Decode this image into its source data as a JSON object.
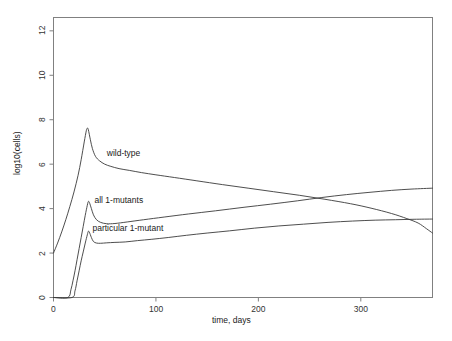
{
  "chart_data": {
    "type": "line",
    "title": "",
    "xlabel": "time, days",
    "ylabel": "log10(cells)",
    "xlim": [
      0,
      370
    ],
    "ylim": [
      0,
      12.6
    ],
    "xticks": [
      0,
      100,
      200,
      300
    ],
    "yticks": [
      0,
      2,
      4,
      6,
      8,
      10,
      12
    ],
    "grid": false,
    "legend": "inline-annotations",
    "annotations": [
      {
        "text": "wild-type",
        "x": 52,
        "y": 6.45
      },
      {
        "text": "all 1-mutants",
        "x": 40,
        "y": 4.35
      },
      {
        "text": "particular 1-mutant",
        "x": 38,
        "y": 3.1
      }
    ],
    "series": [
      {
        "name": "wild-type",
        "x": [
          0,
          4,
          8,
          12,
          16,
          20,
          24,
          27,
          30,
          32,
          33,
          34,
          36,
          38,
          41,
          45,
          50,
          56,
          64,
          74,
          86,
          100,
          118,
          140,
          165,
          190,
          215,
          240,
          265,
          290,
          310,
          330,
          345,
          356,
          364,
          370
        ],
        "y": [
          2.0,
          2.45,
          2.95,
          3.5,
          4.1,
          4.75,
          5.5,
          6.2,
          7.0,
          7.5,
          7.62,
          7.55,
          7.1,
          6.7,
          6.35,
          6.15,
          6.0,
          5.9,
          5.8,
          5.72,
          5.62,
          5.52,
          5.4,
          5.25,
          5.08,
          4.92,
          4.76,
          4.6,
          4.42,
          4.22,
          4.02,
          3.78,
          3.55,
          3.35,
          3.1,
          2.9
        ]
      },
      {
        "name": "all 1-mutants",
        "x": [
          0,
          14,
          17,
          19,
          21,
          23,
          25,
          27,
          29,
          31,
          33,
          34,
          35,
          37,
          39,
          42,
          46,
          52,
          60,
          72,
          88,
          108,
          132,
          158,
          186,
          212,
          238,
          262,
          286,
          308,
          330,
          350,
          370
        ],
        "y": [
          0.0,
          0.0,
          0.35,
          0.75,
          1.2,
          1.7,
          2.2,
          2.7,
          3.2,
          3.7,
          4.15,
          4.32,
          4.28,
          4.0,
          3.72,
          3.5,
          3.38,
          3.32,
          3.33,
          3.4,
          3.5,
          3.62,
          3.76,
          3.9,
          4.06,
          4.2,
          4.35,
          4.5,
          4.63,
          4.73,
          4.82,
          4.88,
          4.92
        ]
      },
      {
        "name": "particular 1-mutant",
        "x": [
          0,
          18,
          21,
          23,
          25,
          27,
          29,
          31,
          33,
          34,
          35,
          37,
          39,
          42,
          46,
          52,
          60,
          70,
          82,
          96,
          112,
          130,
          150,
          172,
          196,
          220,
          244,
          268,
          292,
          314,
          334,
          352,
          370
        ],
        "y": [
          0.0,
          0.0,
          0.3,
          0.75,
          1.2,
          1.65,
          2.05,
          2.45,
          2.82,
          2.98,
          2.94,
          2.7,
          2.52,
          2.45,
          2.44,
          2.46,
          2.48,
          2.5,
          2.56,
          2.62,
          2.7,
          2.8,
          2.9,
          3.0,
          3.12,
          3.22,
          3.3,
          3.38,
          3.44,
          3.48,
          3.5,
          3.52,
          3.53
        ]
      }
    ],
    "style": {
      "line_color": "#3a3a3a",
      "frame_color": "#808080",
      "background": "#ffffff"
    }
  },
  "axes": {
    "x_tick_labels": [
      "0",
      "100",
      "200",
      "300"
    ],
    "y_tick_labels": [
      "0",
      "2",
      "4",
      "6",
      "8",
      "10",
      "12"
    ],
    "x_axis_title": "time, days",
    "y_axis_title": "log10(cells)"
  },
  "curve_labels": {
    "wild_type": "wild-type",
    "all_one_mutants": "all 1-mutants",
    "particular_one_mutant": "particular 1-mutant"
  }
}
